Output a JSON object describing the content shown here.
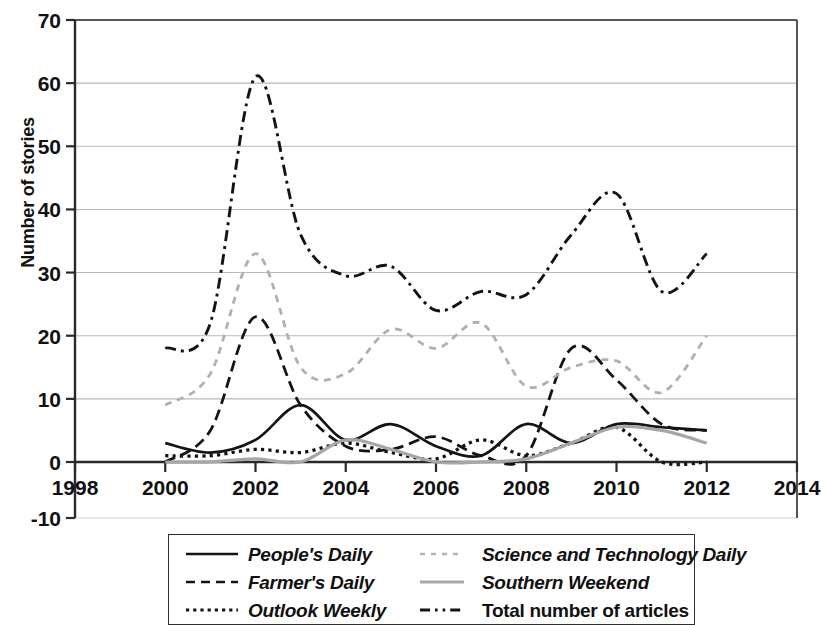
{
  "chart_data": {
    "type": "line",
    "title": "",
    "xlabel": "",
    "ylabel": "Number of stories",
    "xlim": [
      1998,
      2014
    ],
    "ylim": [
      0,
      70
    ],
    "y_extra_label": "-10",
    "xticks": [
      "1998",
      "2000",
      "2002",
      "2004",
      "2006",
      "2008",
      "2010",
      "2012",
      "2014"
    ],
    "yticks": [
      "0",
      "10",
      "20",
      "30",
      "40",
      "50",
      "60",
      "70"
    ],
    "grid": "horizontal",
    "legend_position": "below-plot",
    "x": [
      2000,
      2001,
      2002,
      2003,
      2004,
      2005,
      2006,
      2007,
      2008,
      2009,
      2010,
      2011,
      2012
    ],
    "series": [
      {
        "name": "People's Daily",
        "style": "solid",
        "color": "#141414",
        "values": [
          3,
          1.5,
          3.5,
          9,
          3.5,
          6,
          2.5,
          1,
          6,
          3,
          6,
          5.5,
          5
        ]
      },
      {
        "name": "Farmer's Daily",
        "style": "dashed",
        "color": "#141414",
        "values": [
          0,
          5,
          23,
          9,
          2.5,
          2,
          4,
          1,
          1,
          18,
          13,
          6,
          5
        ]
      },
      {
        "name": "Outlook Weekly",
        "style": "dotted",
        "color": "#141414",
        "values": [
          1,
          1,
          2,
          1.5,
          3,
          1.5,
          0.5,
          3.5,
          1,
          3,
          5.5,
          0,
          0
        ]
      },
      {
        "name": "Science and Technology Daily",
        "style": "dashed-light",
        "color": "#b0b0b0",
        "values": [
          9,
          14,
          33,
          15,
          14,
          21,
          18,
          22,
          12,
          15,
          16,
          11,
          20
        ]
      },
      {
        "name": "Southern Weekend",
        "style": "solid-light",
        "color": "#a6a6a6",
        "values": [
          0,
          0,
          0.5,
          0,
          3.5,
          2,
          0,
          0,
          0.5,
          3,
          5.5,
          5,
          3
        ]
      },
      {
        "name": "Total number of articles",
        "style": "dash-dot",
        "color": "#141414",
        "values": [
          18,
          22,
          61,
          36,
          29.5,
          31,
          24,
          27,
          26.5,
          36,
          42.5,
          27,
          33
        ]
      }
    ]
  },
  "axis": {
    "ylabel": "Number of stories",
    "yticks": [
      "70",
      "60",
      "50",
      "40",
      "30",
      "20",
      "10",
      "0"
    ],
    "ynegative": "-10",
    "xticks": [
      "1998",
      "2000",
      "2002",
      "2004",
      "2006",
      "2008",
      "2010",
      "2012",
      "2014"
    ]
  },
  "legend": {
    "items": [
      {
        "label": "People's Daily",
        "swatch": "solid-dark-line-swatch"
      },
      {
        "label": "Science and Technology Daily",
        "swatch": "light-dashed-line-swatch"
      },
      {
        "label": "Farmer's Daily",
        "swatch": "dark-dashed-line-swatch"
      },
      {
        "label": "Southern Weekend",
        "swatch": "light-solid-line-swatch"
      },
      {
        "label": "Outlook Weekly",
        "swatch": "dark-dotted-line-swatch"
      },
      {
        "label": "Total number of articles",
        "swatch": "dash-dot-line-swatch"
      }
    ]
  }
}
